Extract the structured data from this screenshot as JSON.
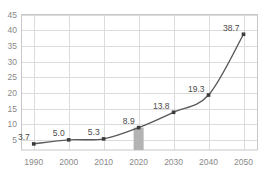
{
  "chart_data": {
    "type": "line",
    "title": "",
    "subtitle": "",
    "xlabel": "",
    "ylabel": "",
    "categories": [
      "1990",
      "2000",
      "2010",
      "2020",
      "2030",
      "2040",
      "2050"
    ],
    "x": [
      1990,
      2000,
      2010,
      2020,
      2030,
      2040,
      2050
    ],
    "values": [
      3.7,
      5.0,
      5.3,
      8.9,
      13.8,
      19.3,
      38.7
    ],
    "point_labels": [
      "3.7",
      "5.0",
      "5.3",
      "8.9",
      "13.8",
      "19.3",
      "38.7"
    ],
    "ylim": [
      0,
      45
    ],
    "xlim": [
      1986.5,
      2054
    ],
    "yticks": [
      5,
      10,
      15,
      20,
      25,
      30,
      35,
      40,
      45
    ],
    "ytick_labels": [
      "5",
      "10",
      "15",
      "20",
      "25",
      "30",
      "35",
      "40",
      "45"
    ],
    "xticks": [
      1990,
      2000,
      2010,
      2020,
      2030,
      2040,
      2050
    ],
    "xtick_labels": [
      "1990",
      "2000",
      "2010",
      "2020",
      "2030",
      "2040",
      "2050"
    ],
    "grid": true,
    "legend": null,
    "legend_position": "none",
    "series": [
      {
        "name": "series-1",
        "values": [
          3.7,
          5.0,
          5.3,
          8.9,
          13.8,
          19.3,
          38.7
        ],
        "line_color": "#5a5a5a",
        "marker_color": "#3c3c3c",
        "marker": "square",
        "smooth": true
      }
    ],
    "highlight_bar": {
      "category": "2020",
      "x": 2020,
      "value": 8.9,
      "color": "#b3b3b3"
    },
    "colors": {
      "line": "#5a5a5a",
      "marker": "#3c3c3c",
      "grid": "#dcdcdc",
      "border": "#c8c8c8",
      "tick_text": "#8a8a8a",
      "label_text": "#4a4a4a",
      "highlight": "#b3b3b3",
      "background": "#ffffff"
    }
  }
}
